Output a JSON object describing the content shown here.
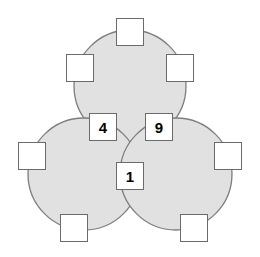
{
  "figure": {
    "canvas": {
      "width": 260,
      "height": 257,
      "background": "#ffffff"
    },
    "style": {
      "circle_fill": "#e1e1e1",
      "circle_stroke": "#7d7d7d",
      "circle_stroke_width": 1.3,
      "box_fill": "#ffffff",
      "box_stroke": "#6b6b6b",
      "box_size": 28,
      "text_color": "#000000"
    },
    "circles": [
      {
        "id": "circle-top",
        "cx": 130,
        "cy": 86,
        "r": 56
      },
      {
        "id": "circle-bottom-left",
        "cx": 84,
        "cy": 174,
        "r": 56
      },
      {
        "id": "circle-bottom-right",
        "cx": 176,
        "cy": 174,
        "r": 56
      }
    ],
    "boxes": [
      {
        "id": "box-top",
        "label": "",
        "filled": false,
        "x": 116,
        "y": 18,
        "w": 28,
        "h": 28
      },
      {
        "id": "box-top-left",
        "label": "",
        "filled": false,
        "x": 66,
        "y": 54,
        "w": 28,
        "h": 28
      },
      {
        "id": "box-top-right",
        "label": "",
        "filled": false,
        "x": 166,
        "y": 54,
        "w": 28,
        "h": 28
      },
      {
        "id": "box-mid-left",
        "label": "4",
        "filled": true,
        "x": 89,
        "y": 113,
        "w": 28,
        "h": 28
      },
      {
        "id": "box-mid-right",
        "label": "9",
        "filled": true,
        "x": 145,
        "y": 113,
        "w": 28,
        "h": 28
      },
      {
        "id": "box-left",
        "label": "",
        "filled": false,
        "x": 18,
        "y": 142,
        "w": 28,
        "h": 28
      },
      {
        "id": "box-right",
        "label": "",
        "filled": false,
        "x": 214,
        "y": 142,
        "w": 28,
        "h": 28
      },
      {
        "id": "box-center",
        "label": "1",
        "filled": true,
        "x": 116,
        "y": 162,
        "w": 28,
        "h": 28
      },
      {
        "id": "box-bottom-left",
        "label": "",
        "filled": false,
        "x": 60,
        "y": 214,
        "w": 28,
        "h": 28
      },
      {
        "id": "box-bottom-right",
        "label": "",
        "filled": false,
        "x": 180,
        "y": 214,
        "w": 28,
        "h": 28
      }
    ],
    "given_values": [
      "4",
      "9",
      "1"
    ]
  }
}
